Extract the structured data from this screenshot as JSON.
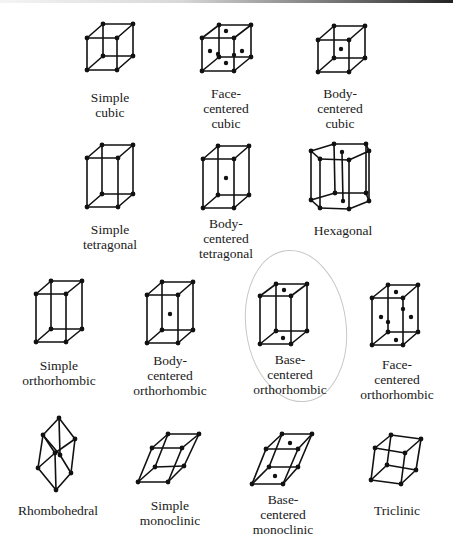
{
  "figure": {
    "stroke_color": "#111111",
    "highlight_color": "#c8c8c8",
    "highlight": {
      "cx": 296,
      "cy": 326,
      "rx": 50,
      "ry": 76,
      "rotate": -8
    }
  },
  "lattices": [
    {
      "id": "simple-cubic",
      "label": "Simple\ncubic",
      "label_x": 110,
      "label_y": 90,
      "front": [
        [
          87,
          38
        ],
        [
          117,
          38
        ],
        [
          117,
          70
        ],
        [
          87,
          70
        ]
      ],
      "back": [
        [
          103,
          24
        ],
        [
          133,
          24
        ],
        [
          133,
          56
        ],
        [
          103,
          56
        ]
      ],
      "dots": []
    },
    {
      "id": "face-centered-cubic",
      "label": "Face-\ncentered\ncubic",
      "label_x": 226,
      "label_y": 86,
      "front": [
        [
          202,
          38
        ],
        [
          234,
          38
        ],
        [
          234,
          71
        ],
        [
          202,
          71
        ]
      ],
      "back": [
        [
          219,
          25
        ],
        [
          251,
          25
        ],
        [
          251,
          57
        ],
        [
          219,
          57
        ]
      ],
      "dots": [
        [
          226,
          31
        ],
        [
          226,
          63
        ],
        [
          210,
          51
        ],
        [
          242,
          51
        ],
        [
          218,
          54
        ],
        [
          234,
          55
        ]
      ]
    },
    {
      "id": "body-centered-cubic",
      "label": "Body-\ncentered\ncubic",
      "label_x": 340,
      "label_y": 86,
      "front": [
        [
          318,
          40
        ],
        [
          349,
          40
        ],
        [
          349,
          72
        ],
        [
          318,
          72
        ]
      ],
      "back": [
        [
          334,
          26
        ],
        [
          365,
          26
        ],
        [
          365,
          58
        ],
        [
          334,
          58
        ]
      ],
      "dots": [
        [
          341,
          49
        ]
      ]
    },
    {
      "id": "simple-tetragonal",
      "label": "Simple\ntetragonal",
      "label_x": 110,
      "label_y": 222,
      "front": [
        [
          87,
          158
        ],
        [
          118,
          158
        ],
        [
          118,
          207
        ],
        [
          87,
          207
        ]
      ],
      "back": [
        [
          102,
          145
        ],
        [
          133,
          145
        ],
        [
          133,
          194
        ],
        [
          102,
          194
        ]
      ],
      "dots": []
    },
    {
      "id": "body-centered-tetragonal",
      "label": "Body-\ncentered\ntetragonal",
      "label_x": 226,
      "label_y": 216,
      "front": [
        [
          203,
          159
        ],
        [
          234,
          159
        ],
        [
          234,
          208
        ],
        [
          203,
          208
        ]
      ],
      "back": [
        [
          218,
          146
        ],
        [
          249,
          146
        ],
        [
          249,
          195
        ],
        [
          218,
          195
        ]
      ],
      "dots": [
        [
          226,
          178
        ]
      ]
    },
    {
      "id": "hexagonal",
      "label": "Hexagonal",
      "label_x": 343,
      "label_y": 223,
      "hex_top": [
        [
          311,
          151
        ],
        [
          320,
          159
        ],
        [
          349,
          160
        ],
        [
          369,
          151
        ],
        [
          366,
          144
        ],
        [
          334,
          144
        ]
      ],
      "hex_bottom": [
        [
          311,
          200
        ],
        [
          320,
          208
        ],
        [
          349,
          209
        ],
        [
          369,
          201
        ],
        [
          366,
          193
        ],
        [
          335,
          193
        ]
      ],
      "hex_center_top": [
        342,
        152
      ],
      "hex_center_bottom": [
        343,
        201
      ]
    },
    {
      "id": "simple-orthorhombic",
      "label": "Simple\northorhombic",
      "label_x": 59,
      "label_y": 358,
      "front": [
        [
          36,
          294
        ],
        [
          66,
          294
        ],
        [
          66,
          342
        ],
        [
          36,
          342
        ]
      ],
      "back": [
        [
          51,
          281
        ],
        [
          82,
          281
        ],
        [
          82,
          329
        ],
        [
          51,
          329
        ]
      ],
      "dots": []
    },
    {
      "id": "body-centered-orthorhombic",
      "label": "Body-\ncentered\northorhombic",
      "label_x": 170,
      "label_y": 353,
      "front": [
        [
          147,
          295
        ],
        [
          178,
          295
        ],
        [
          178,
          343
        ],
        [
          147,
          343
        ]
      ],
      "back": [
        [
          162,
          282
        ],
        [
          193,
          282
        ],
        [
          193,
          330
        ],
        [
          162,
          330
        ]
      ],
      "dots": [
        [
          170,
          314
        ]
      ]
    },
    {
      "id": "base-centered-orthorhombic",
      "label": "Base-\ncentered\northorhombic",
      "label_x": 290,
      "label_y": 352,
      "front": [
        [
          260,
          296
        ],
        [
          291,
          296
        ],
        [
          291,
          344
        ],
        [
          260,
          344
        ]
      ],
      "back": [
        [
          276,
          284
        ],
        [
          307,
          284
        ],
        [
          307,
          331
        ],
        [
          276,
          331
        ]
      ],
      "dots": [
        [
          284,
          290
        ],
        [
          283,
          338
        ]
      ]
    },
    {
      "id": "face-centered-orthorhombic",
      "label": "Face-\ncentered\northorhombic",
      "label_x": 397,
      "label_y": 357,
      "front": [
        [
          372,
          298
        ],
        [
          403,
          298
        ],
        [
          403,
          345
        ],
        [
          372,
          345
        ]
      ],
      "back": [
        [
          388,
          285
        ],
        [
          418,
          285
        ],
        [
          418,
          332
        ],
        [
          388,
          332
        ]
      ],
      "dots": [
        [
          396,
          292
        ],
        [
          396,
          340
        ],
        [
          381,
          317
        ],
        [
          411,
          317
        ],
        [
          403,
          309
        ],
        [
          388,
          322
        ]
      ]
    },
    {
      "id": "rhombohedral",
      "label": "Rhombohedral",
      "label_x": 58,
      "label_y": 503,
      "rhombo": {
        "top": [
          59,
          418
        ],
        "ul": [
          43,
          435
        ],
        "ur": [
          75,
          439
        ],
        "m1": [
          55,
          453
        ],
        "m2": [
          60,
          455
        ],
        "ll": [
          38,
          468
        ],
        "lr": [
          71,
          473
        ],
        "bottom": [
          56,
          490
        ]
      }
    },
    {
      "id": "simple-monoclinic",
      "label": "Simple\nmonoclinic",
      "label_x": 170,
      "label_y": 498,
      "front": [
        [
          152,
          448
        ],
        [
          182,
          448
        ],
        [
          168,
          482
        ],
        [
          138,
          482
        ]
      ],
      "back": [
        [
          168,
          434
        ],
        [
          199,
          434
        ],
        [
          184,
          466
        ],
        [
          155,
          467
        ]
      ],
      "dots": []
    },
    {
      "id": "base-centered-monoclinic",
      "label": "Base-\ncentered\nmonoclinic",
      "label_x": 283,
      "label_y": 492,
      "front": [
        [
          266,
          449
        ],
        [
          298,
          449
        ],
        [
          283,
          484
        ],
        [
          252,
          484
        ]
      ],
      "back": [
        [
          282,
          434
        ],
        [
          312,
          434
        ],
        [
          298,
          467
        ],
        [
          269,
          467
        ]
      ],
      "dots": [
        [
          290,
          443
        ],
        [
          275,
          476
        ]
      ]
    },
    {
      "id": "triclinic",
      "label": "Triclinic",
      "label_x": 397,
      "label_y": 503,
      "front": [
        [
          375,
          448
        ],
        [
          405,
          453
        ],
        [
          401,
          484
        ],
        [
          371,
          480
        ]
      ],
      "back": [
        [
          391,
          435
        ],
        [
          421,
          439
        ],
        [
          416,
          470
        ],
        [
          387,
          465
        ]
      ],
      "dots": []
    }
  ]
}
